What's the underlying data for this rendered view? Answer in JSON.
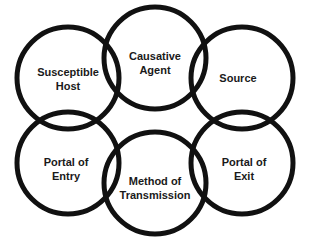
{
  "diagram": {
    "stroke_color": "#111111",
    "background": "#ffffff",
    "nodes": [
      {
        "id": "susceptible-host",
        "lines": [
          "Susceptible",
          "Host"
        ],
        "cx": 68,
        "cy": 78,
        "r": 51
      },
      {
        "id": "causative-agent",
        "lines": [
          "Causative",
          "Agent"
        ],
        "cx": 155,
        "cy": 58,
        "r": 51
      },
      {
        "id": "source",
        "lines": [
          "Source"
        ],
        "cx": 242,
        "cy": 78,
        "r": 51
      },
      {
        "id": "portal-of-entry",
        "lines": [
          "Portal of",
          "Entry"
        ],
        "cx": 68,
        "cy": 163,
        "r": 51
      },
      {
        "id": "method-of-transmission",
        "lines": [
          "Method of",
          "Transmission"
        ],
        "cx": 155,
        "cy": 183,
        "r": 51
      },
      {
        "id": "portal-of-exit",
        "lines": [
          "Portal of",
          "Exit"
        ],
        "cx": 242,
        "cy": 163,
        "r": 51
      }
    ]
  }
}
